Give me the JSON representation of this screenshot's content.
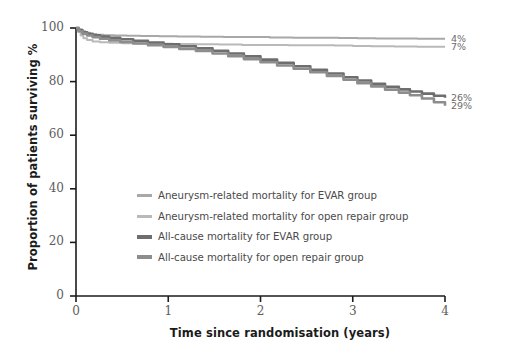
{
  "chart_data": {
    "type": "line",
    "title": "",
    "xlabel": "Time since randomisation (years)",
    "ylabel": "Proportion of patients surviving %",
    "xlim": [
      0,
      4
    ],
    "ylim": [
      0,
      100
    ],
    "xticks": [
      "0",
      "1",
      "2",
      "3",
      "4"
    ],
    "yticks": [
      "0",
      "20",
      "40",
      "60",
      "80",
      "100"
    ],
    "grid": false,
    "legend_position": "center-left",
    "annotations": [
      {
        "text": "4%",
        "series": "Aneurysm-related mortality for EVAR group",
        "x": 4,
        "y": 96
      },
      {
        "text": "7%",
        "series": "Aneurysm-related mortality for open repair group",
        "x": 4,
        "y": 93
      },
      {
        "text": "26%",
        "series": "All-cause mortality for EVAR group",
        "x": 4,
        "y": 74
      },
      {
        "text": "29%",
        "series": "All-cause mortality for open repair group",
        "x": 4,
        "y": 71
      }
    ],
    "series": [
      {
        "name": "Aneurysm-related mortality for EVAR group",
        "color": "#a8a8a8",
        "width": 2.0,
        "end_label": "4%",
        "x": [
          0.0,
          0.03,
          0.06,
          0.1,
          0.15,
          0.22,
          0.3,
          0.42,
          0.55,
          0.7,
          0.9,
          1.1,
          1.35,
          1.6,
          1.85,
          2.1,
          2.35,
          2.6,
          2.85,
          3.05,
          3.25,
          3.45,
          3.7,
          4.0
        ],
        "y": [
          100.0,
          99.4,
          98.8,
          98.2,
          97.8,
          97.5,
          97.3,
          97.2,
          97.1,
          97.0,
          96.9,
          96.8,
          96.7,
          96.6,
          96.6,
          96.5,
          96.4,
          96.4,
          96.3,
          96.2,
          96.1,
          96.1,
          96.0,
          96.0
        ]
      },
      {
        "name": "Aneurysm-related mortality for open repair group",
        "color": "#b9b9b9",
        "width": 2.0,
        "end_label": "7%",
        "x": [
          0.0,
          0.02,
          0.05,
          0.08,
          0.12,
          0.18,
          0.26,
          0.36,
          0.5,
          0.65,
          0.85,
          1.05,
          1.3,
          1.55,
          1.8,
          2.05,
          2.3,
          2.55,
          2.8,
          3.0,
          3.2,
          3.45,
          3.7,
          4.0
        ],
        "y": [
          100.0,
          98.6,
          97.2,
          96.2,
          95.5,
          95.0,
          94.7,
          94.5,
          94.3,
          94.2,
          94.1,
          94.0,
          93.9,
          93.8,
          93.7,
          93.7,
          93.6,
          93.6,
          93.5,
          93.3,
          93.2,
          93.1,
          93.0,
          93.0
        ]
      },
      {
        "name": "All-cause mortality for EVAR group",
        "color": "#6e6e6e",
        "width": 2.6,
        "end_label": "26%",
        "x": [
          0.0,
          0.03,
          0.07,
          0.12,
          0.18,
          0.26,
          0.36,
          0.48,
          0.62,
          0.78,
          0.95,
          1.12,
          1.3,
          1.48,
          1.65,
          1.82,
          2.0,
          2.18,
          2.36,
          2.54,
          2.72,
          2.9,
          3.05,
          3.2,
          3.35,
          3.5,
          3.62,
          3.75,
          3.88,
          4.0
        ],
        "y": [
          100.0,
          99.2,
          98.4,
          97.8,
          97.3,
          96.8,
          96.3,
          95.8,
          95.2,
          94.6,
          93.9,
          93.2,
          92.4,
          91.5,
          90.5,
          89.4,
          88.2,
          87.0,
          85.7,
          84.4,
          83.0,
          81.6,
          80.4,
          79.2,
          78.1,
          77.1,
          76.3,
          75.5,
          74.7,
          74.0
        ]
      },
      {
        "name": "All-cause mortality for open repair group",
        "color": "#8d8d8d",
        "width": 2.6,
        "end_label": "29%",
        "x": [
          0.0,
          0.03,
          0.07,
          0.12,
          0.18,
          0.26,
          0.36,
          0.48,
          0.62,
          0.78,
          0.95,
          1.12,
          1.3,
          1.48,
          1.65,
          1.82,
          2.0,
          2.18,
          2.36,
          2.54,
          2.72,
          2.9,
          3.05,
          3.2,
          3.35,
          3.5,
          3.62,
          3.75,
          3.88,
          4.0
        ],
        "y": [
          100.0,
          98.8,
          97.9,
          97.2,
          96.6,
          96.0,
          95.4,
          94.8,
          94.2,
          93.6,
          92.9,
          92.2,
          91.4,
          90.5,
          89.5,
          88.4,
          87.2,
          86.0,
          84.8,
          83.5,
          82.1,
          80.7,
          79.4,
          78.2,
          77.0,
          75.9,
          74.9,
          73.7,
          72.3,
          71.0
        ]
      }
    ]
  },
  "legend": {
    "items": [
      {
        "label": "Aneurysm-related mortality for EVAR group",
        "color": "#a8a8a8",
        "thick": false
      },
      {
        "label": "Aneurysm-related mortality for open repair group",
        "color": "#b9b9b9",
        "thick": false
      },
      {
        "label": "All-cause mortality for EVAR group",
        "color": "#6e6e6e",
        "thick": true
      },
      {
        "label": "All-cause mortality for open repair group",
        "color": "#8d8d8d",
        "thick": true
      }
    ]
  },
  "axis_colors": {
    "axis_line": "#1b1b1b",
    "tick_label": "#5d5d5d",
    "axis_title": "#1b1b1b"
  }
}
